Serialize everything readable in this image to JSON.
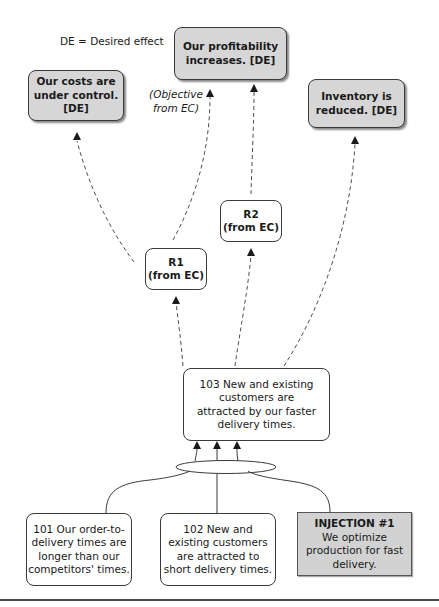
{
  "legend": {
    "text": "DE = Desired effect"
  },
  "desired_effects": {
    "profitability": {
      "line1": "Our profitability",
      "line2": "increases. [DE]"
    },
    "costs": {
      "line1": "Our  costs are",
      "line2": "under control.",
      "line3": "[DE]"
    },
    "inventory": {
      "line1": "Inventory is",
      "line2": "reduced. [DE]"
    }
  },
  "objective_note": {
    "line1": "(Objective",
    "line2": "from EC)"
  },
  "requirements": {
    "r1": {
      "line1": "R1",
      "line2": "(from EC)"
    },
    "r2": {
      "line1": "R2",
      "line2": "(from EC)"
    }
  },
  "entity_103": {
    "line1": "103 New and existing",
    "line2": "customers are",
    "line3": "attracted by our faster",
    "line4": "delivery times."
  },
  "entity_101": {
    "line1": "101 Our order-to-",
    "line2": "delivery times are",
    "line3": "longer than our",
    "line4": "competitors' times."
  },
  "entity_102": {
    "line1": "102  New and",
    "line2": "existing customers",
    "line3": "are attracted to",
    "line4": "short delivery times."
  },
  "injection": {
    "title": "INJECTION #1",
    "line1": "We optimize",
    "line2": "production for fast",
    "line3": "delivery."
  },
  "colors": {
    "de_fill": "#d6d6d6",
    "injection_fill": "#d2d2d2",
    "line": "#3a3a3a"
  }
}
